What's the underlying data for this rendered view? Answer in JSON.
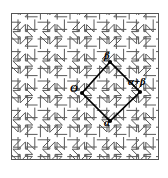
{
  "figure": {
    "frame": {
      "x": 11,
      "y": 13,
      "width": 148,
      "height": 147,
      "stroke_color": "#555555",
      "stroke_width": 1
    },
    "background_color": "#ffffff",
    "tiling": {
      "motif_name": "pinwheel-cross-tile",
      "stroke_color": "#5a5a5a",
      "stroke_width": 1,
      "period_x": 29.6,
      "period_y": 29.4,
      "origin_x": 82,
      "origin_y": 93
    },
    "rhombus": {
      "name": "fundamental-domain",
      "stroke_color": "#000000",
      "stroke_width": 1.6,
      "vertices": [
        {
          "id": "O",
          "x": 82,
          "y": 93
        },
        {
          "id": "beta",
          "x": 110,
          "y": 62
        },
        {
          "id": "alpha_plus_beta",
          "x": 140,
          "y": 92
        },
        {
          "id": "alpha",
          "x": 110,
          "y": 121
        }
      ],
      "vertex_dot_radius": 2.1,
      "vertex_dot_color": "#000000"
    },
    "labels": {
      "origin": "O",
      "beta": "β",
      "alpha": "α",
      "alpha_plus_beta": "α+β"
    }
  }
}
